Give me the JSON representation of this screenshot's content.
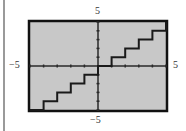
{
  "labels": {
    "y_max": "5",
    "y_min": "−5",
    "x_min": "−5",
    "x_max": "5"
  },
  "colors": {
    "frame": "#111111",
    "plot_background": "#c8c8c8",
    "curve": "#1a1a1a",
    "axes": "#2a2a2a",
    "left_rule": "#9a9a9a"
  },
  "chart_data": {
    "type": "line",
    "subtype": "step",
    "title": "",
    "xlabel": "",
    "ylabel": "",
    "xlim": [
      -5,
      5
    ],
    "ylim": [
      -5,
      5
    ],
    "x_ticks": [
      -5,
      -4,
      -3,
      -2,
      -1,
      0,
      1,
      2,
      3,
      4,
      5
    ],
    "y_ticks": [
      -5,
      -4,
      -3,
      -2,
      -1,
      0,
      1,
      2,
      3,
      4,
      5
    ],
    "tick_labels": {
      "x_min": "−5",
      "x_max": "5",
      "y_min": "−5",
      "y_max": "5"
    },
    "grid": false,
    "legend": null,
    "value_source": "estimated from pixel geometry; no function label shown",
    "observed_shape": "flat segments at integer heights, each jumping up by 1 at the next integer x; consistent with y = floor(x)",
    "steps": [
      {
        "x_start": -5,
        "x_end": -4,
        "y": -5
      },
      {
        "x_start": -4,
        "x_end": -3,
        "y": -4
      },
      {
        "x_start": -3,
        "x_end": -2,
        "y": -3
      },
      {
        "x_start": -2,
        "x_end": -1,
        "y": -2
      },
      {
        "x_start": -1,
        "x_end": 0,
        "y": -1
      },
      {
        "x_start": 0,
        "x_end": 1,
        "y": 0,
        "note": "coincides with x-axis, not separately visible"
      },
      {
        "x_start": 1,
        "x_end": 2,
        "y": 1
      },
      {
        "x_start": 2,
        "x_end": 3,
        "y": 2
      },
      {
        "x_start": 3,
        "x_end": 4,
        "y": 3
      },
      {
        "x_start": 4,
        "x_end": 5,
        "y": 4
      },
      {
        "x_start": 5,
        "x_end": 5,
        "y": 5,
        "note": "visible only as short vertical at right edge"
      }
    ]
  }
}
